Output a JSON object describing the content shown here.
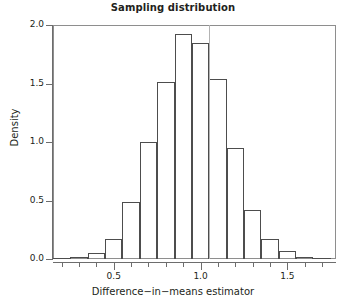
{
  "chart_data": {
    "type": "bar",
    "title": "Sampling distribution",
    "xlabel": "Difference−in−means estimator",
    "ylabel": "Density",
    "xlim": [
      0.15,
      1.78
    ],
    "ylim": [
      0.0,
      2.0
    ],
    "grid": false,
    "legend": null,
    "bin_width": 0.1,
    "bin_edges": [
      0.15,
      0.25,
      0.35,
      0.45,
      0.55,
      0.65,
      0.75,
      0.85,
      0.95,
      1.05,
      1.15,
      1.25,
      1.35,
      1.45,
      1.55,
      1.65,
      1.75
    ],
    "categories": [
      "0.15-0.25",
      "0.25-0.35",
      "0.35-0.45",
      "0.45-0.55",
      "0.55-0.65",
      "0.65-0.75",
      "0.75-0.85",
      "0.85-0.95",
      "0.95-1.05",
      "1.05-1.15",
      "1.15-1.25",
      "1.25-1.35",
      "1.35-1.45",
      "1.45-1.55",
      "1.55-1.65",
      "1.65-1.75"
    ],
    "values": [
      0.01,
      0.02,
      0.05,
      0.17,
      0.49,
      1.0,
      1.51,
      1.92,
      1.85,
      1.54,
      0.95,
      0.42,
      0.17,
      0.07,
      0.02,
      0.01
    ],
    "annotations": [
      {
        "type": "vertical-line",
        "x": 1.05,
        "color": "#b3b3b3",
        "label": "true-value-reference-line"
      }
    ],
    "xticks_major": [
      0.5,
      1.0,
      1.5
    ],
    "xtick_labels": [
      "0.5",
      "1.0",
      "1.5"
    ],
    "xticks_minor": [
      0.2,
      0.3,
      0.4,
      0.6,
      0.7,
      0.8,
      0.9,
      1.1,
      1.2,
      1.3,
      1.4,
      1.6,
      1.7
    ],
    "yticks": [
      0.0,
      0.5,
      1.0,
      1.5,
      2.0
    ],
    "ytick_labels": [
      "0.0",
      "0.5",
      "1.0",
      "1.5",
      "2.0"
    ],
    "colors": {
      "bar_outline": "#4d4d4d",
      "bar_fill": "none",
      "frame": "#8e8e8e",
      "axis": "#6d6d6d",
      "text": "#231f20",
      "reference_line": "#b3b3b3",
      "background": "#ffffff"
    }
  }
}
